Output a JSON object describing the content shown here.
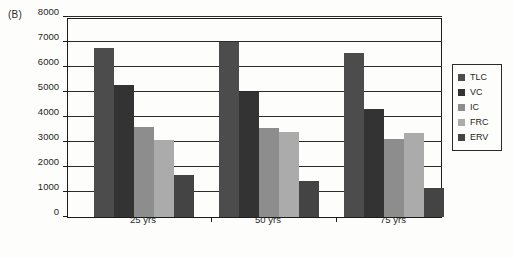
{
  "panel": {
    "label": "(B)"
  },
  "chart_data": {
    "type": "bar",
    "title": "",
    "xlabel": "",
    "ylabel": "",
    "categories": [
      "25 yrs",
      "50 yrs",
      "75 yrs"
    ],
    "ylim": [
      0,
      8000
    ],
    "yticks": [
      0,
      1000,
      2000,
      3000,
      4000,
      5000,
      6000,
      7000,
      8000
    ],
    "ytick_labels": [
      "0",
      "1000",
      "2000",
      "3000",
      "4000",
      "5000",
      "6000",
      "7000",
      "8000"
    ],
    "grid": true,
    "legend_position": "right-outside",
    "series": [
      {
        "name": "TLC",
        "color": "#4c4c4c",
        "values": [
          6750,
          7000,
          6550
        ]
      },
      {
        "name": "VC",
        "color": "#333333",
        "values": [
          5300,
          5020,
          4320
        ]
      },
      {
        "name": "IC",
        "color": "#8d8d8d",
        "values": [
          3600,
          3550,
          3130
        ]
      },
      {
        "name": "FRC",
        "color": "#ababab",
        "values": [
          3100,
          3420,
          3350
        ]
      },
      {
        "name": "ERV",
        "color": "#444444",
        "values": [
          1670,
          1450,
          1150
        ]
      }
    ]
  }
}
